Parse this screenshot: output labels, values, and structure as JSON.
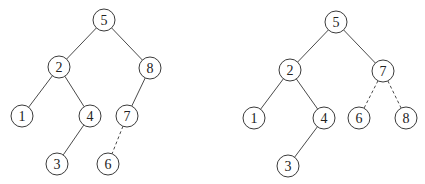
{
  "diagram": {
    "type": "binary-search-tree-comparison",
    "trees": [
      {
        "name": "left-tree",
        "nodes": [
          {
            "id": "5",
            "label": "5",
            "x": 104,
            "y": 20
          },
          {
            "id": "2",
            "label": "2",
            "x": 59,
            "y": 67
          },
          {
            "id": "8",
            "label": "8",
            "x": 150,
            "y": 68
          },
          {
            "id": "1",
            "label": "1",
            "x": 22,
            "y": 116
          },
          {
            "id": "4",
            "label": "4",
            "x": 90,
            "y": 116
          },
          {
            "id": "7",
            "label": "7",
            "x": 127,
            "y": 116
          },
          {
            "id": "3",
            "label": "3",
            "x": 57,
            "y": 164
          },
          {
            "id": "6",
            "label": "6",
            "x": 108,
            "y": 164
          }
        ],
        "edges": [
          {
            "from": "5",
            "to": "2",
            "style": "solid"
          },
          {
            "from": "5",
            "to": "8",
            "style": "solid"
          },
          {
            "from": "2",
            "to": "1",
            "style": "solid"
          },
          {
            "from": "2",
            "to": "4",
            "style": "solid"
          },
          {
            "from": "8",
            "to": "7",
            "style": "solid"
          },
          {
            "from": "4",
            "to": "3",
            "style": "solid"
          },
          {
            "from": "7",
            "to": "6",
            "style": "dashed"
          }
        ]
      },
      {
        "name": "right-tree",
        "nodes": [
          {
            "id": "5",
            "label": "5",
            "x": 336,
            "y": 22
          },
          {
            "id": "2",
            "label": "2",
            "x": 290,
            "y": 70
          },
          {
            "id": "7",
            "label": "7",
            "x": 383,
            "y": 71
          },
          {
            "id": "1",
            "label": "1",
            "x": 254,
            "y": 118
          },
          {
            "id": "4",
            "label": "4",
            "x": 324,
            "y": 118
          },
          {
            "id": "6",
            "label": "6",
            "x": 359,
            "y": 118
          },
          {
            "id": "8",
            "label": "8",
            "x": 406,
            "y": 118
          },
          {
            "id": "3",
            "label": "3",
            "x": 288,
            "y": 166
          }
        ],
        "edges": [
          {
            "from": "5",
            "to": "2",
            "style": "solid"
          },
          {
            "from": "5",
            "to": "7",
            "style": "solid"
          },
          {
            "from": "2",
            "to": "1",
            "style": "solid"
          },
          {
            "from": "2",
            "to": "4",
            "style": "solid"
          },
          {
            "from": "4",
            "to": "3",
            "style": "solid"
          },
          {
            "from": "7",
            "to": "6",
            "style": "dashed"
          },
          {
            "from": "7",
            "to": "8",
            "style": "dashed"
          }
        ]
      }
    ],
    "node_radius": 11,
    "colors": {
      "stroke": "#3a3a3a",
      "fill": "#ffffff",
      "text": "#222222"
    }
  }
}
